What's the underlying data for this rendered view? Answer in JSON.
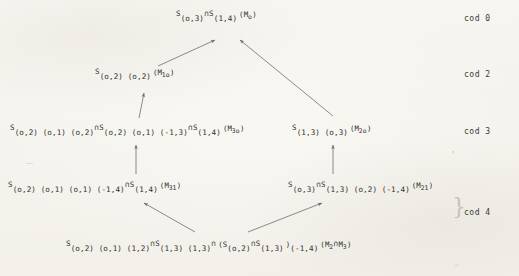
{
  "document": {
    "kind": "scanned-mathematical-diagram",
    "title": "Codimension lattice of Schubert intersection strata",
    "paper_color": "#fbfaf6",
    "ink_color": "#2b2b2b",
    "arrow_color": "#6b6b6b"
  },
  "nodes": [
    {
      "id": "node-cod0",
      "codimension": "cod 0",
      "label": "S_(o,3) ∩ S_(1,4) (M_o)",
      "parts": [
        {
          "type": "S",
          "text": "S"
        },
        {
          "type": "idx",
          "text": "(o,3)"
        },
        {
          "type": "cap",
          "text": "∩"
        },
        {
          "type": "S",
          "text": "S"
        },
        {
          "type": "idx",
          "text": "(1,4)"
        },
        {
          "type": "mtag",
          "text": "(M",
          "sub": "o",
          "close": ")"
        }
      ]
    },
    {
      "id": "node-cod2",
      "codimension": "cod 2",
      "label": "S_(o,2)(o,2) (M_1o)",
      "parts": [
        {
          "type": "S",
          "text": "S"
        },
        {
          "type": "idx",
          "text": "(o,2) (o,2)"
        },
        {
          "type": "mtag",
          "text": "(M",
          "sub": "1o",
          "close": ")"
        }
      ]
    },
    {
      "id": "node-cod3-left",
      "codimension": "cod 3",
      "label": "S_(o,2)(o,1)(o,2) ∩ S_(o,2)(o,1)(-1,3) ∩ S_(1,4) (M_3o)",
      "parts": [
        {
          "type": "S",
          "text": "S"
        },
        {
          "type": "idx",
          "text": "(o,2) (o,1) (o,2)"
        },
        {
          "type": "cap",
          "text": "∩"
        },
        {
          "type": "S",
          "text": "S"
        },
        {
          "type": "idx",
          "text": "(o,2) (o,1) (-1,3)"
        },
        {
          "type": "cap",
          "text": "∩"
        },
        {
          "type": "S",
          "text": "S"
        },
        {
          "type": "idx",
          "text": "(1,4)"
        },
        {
          "type": "mtag",
          "text": "(M",
          "sub": "3o",
          "close": ")"
        }
      ]
    },
    {
      "id": "node-cod3-right",
      "codimension": "cod 3",
      "label": "S_(1,3)(o,3) (M_2o)",
      "parts": [
        {
          "type": "S",
          "text": "S"
        },
        {
          "type": "idx",
          "text": "(1,3) (o,3)"
        },
        {
          "type": "mtag",
          "text": "(M",
          "sub": "2o",
          "close": ")"
        }
      ]
    },
    {
      "id": "node-cod4-left",
      "codimension": "cod 4",
      "label": "S_(o,2)(o,1)(o,1)(-1,4) ∩ S_(1,4) (M_31)",
      "parts": [
        {
          "type": "S",
          "text": "S"
        },
        {
          "type": "idx",
          "text": "(o,2) (o,1) (o,1) (-1,4)"
        },
        {
          "type": "cap",
          "text": "∩"
        },
        {
          "type": "S",
          "text": "S"
        },
        {
          "type": "idx",
          "text": "(1,4)"
        },
        {
          "type": "mtag",
          "text": "(M",
          "sub": "31",
          "close": ")"
        }
      ]
    },
    {
      "id": "node-cod4-right",
      "codimension": "cod 4",
      "label": "S_(o,3) ∩ S_(1,3)(o,2)(-1,4) (M_21)",
      "parts": [
        {
          "type": "S",
          "text": "S"
        },
        {
          "type": "idx",
          "text": "(o,3)"
        },
        {
          "type": "cap",
          "text": "∩"
        },
        {
          "type": "S",
          "text": "S"
        },
        {
          "type": "idx",
          "text": "(1,3) (o,2) (-1,4)"
        },
        {
          "type": "mtag",
          "text": "(M",
          "sub": "21",
          "close": ")"
        }
      ]
    },
    {
      "id": "node-bottom",
      "codimension": "cod 4",
      "label": "S_(o,2)(o,1)(1,2) ∩ S_(1,3)(1,3) ∩ (S_(o,2) ∩ S_(1,3))(-1,4) (M_2 ∩ M_3)",
      "parts": [
        {
          "type": "S",
          "text": "S"
        },
        {
          "type": "idx",
          "text": "(o,2) (o,1) (1,2)"
        },
        {
          "type": "cap",
          "text": "∩"
        },
        {
          "type": "S",
          "text": "S"
        },
        {
          "type": "idx",
          "text": "(1,3) (1,3)"
        },
        {
          "type": "cap",
          "text": "∩"
        },
        {
          "type": "mtag",
          "text": "(S",
          "sub": "",
          "close": ""
        },
        {
          "type": "idx",
          "text": "(o,2)"
        },
        {
          "type": "cap",
          "text": "∩"
        },
        {
          "type": "S",
          "text": "S"
        },
        {
          "type": "idx",
          "text": "(1,3)"
        },
        {
          "type": "mtag2",
          "text": ")"
        },
        {
          "type": "idx",
          "text": "(-1,4)"
        },
        {
          "type": "mtag",
          "text": "(M",
          "sub": "2",
          "close": ""
        },
        {
          "type": "cap",
          "text": "∩"
        },
        {
          "type": "mtag",
          "text": "M",
          "sub": "3",
          "close": ")"
        }
      ]
    }
  ],
  "cod_labels": [
    {
      "id": "cod-0",
      "text": "cod 0"
    },
    {
      "id": "cod-2",
      "text": "cod 2"
    },
    {
      "id": "cod-3",
      "text": "cod 3"
    },
    {
      "id": "cod-4",
      "text": "cod 4"
    }
  ],
  "arrows": [
    {
      "id": "arrow-cod2-to-cod0",
      "from": "node-cod2",
      "to": "node-cod0",
      "direction": "up-right"
    },
    {
      "id": "arrow-cod3right-to-cod0",
      "from": "node-cod3-right",
      "to": "node-cod0",
      "direction": "up-left"
    },
    {
      "id": "arrow-cod3left-to-cod2",
      "from": "node-cod3-left",
      "to": "node-cod2",
      "direction": "up"
    },
    {
      "id": "arrow-cod4left-to-cod3left",
      "from": "node-cod4-left",
      "to": "node-cod3-left",
      "direction": "up"
    },
    {
      "id": "arrow-cod4right-to-cod3right",
      "from": "node-cod4-right",
      "to": "node-cod3-right",
      "direction": "up"
    },
    {
      "id": "arrow-bottom-to-cod4left",
      "from": "node-bottom",
      "to": "node-cod4-left",
      "direction": "up-left"
    },
    {
      "id": "arrow-bottom-to-cod4right",
      "from": "node-bottom",
      "to": "node-cod4-right",
      "direction": "up-right"
    }
  ],
  "glyphs": {
    "intersection": "∩",
    "brace_mark": "}",
    "tick_mark": "'"
  }
}
